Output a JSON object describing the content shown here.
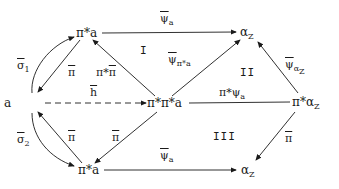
{
  "diagram": {
    "type": "commutative-diagram",
    "nodes": {
      "top_left": "π*a",
      "top_right_base": "α",
      "top_right_sub": "Z",
      "left": "a",
      "center": "π*π*a",
      "right_base": "π*α",
      "right_sub": "Z",
      "bottom_left": "π*a",
      "bottom_right_base": "α",
      "bottom_right_sub": "Z"
    },
    "edges": {
      "top_psi_base": "ψ",
      "top_psi_sub": "a",
      "sigma1_base": "σ",
      "sigma1_sub": "1",
      "sigma2_base": "σ",
      "sigma2_sub": "2",
      "pi_up": "π",
      "pistar_pi": "π*",
      "pistar_pi_bar": "π",
      "h_bar": "h",
      "psi_pistar_base": "ψ",
      "psi_pistar_sub": "π*a",
      "pistar_psi_prefix": "π*ψ",
      "pistar_psi_sub": "a",
      "psi_alpha_base": "ψ",
      "psi_alpha_sub": "α",
      "psi_alpha_subsub": "Z",
      "pi_bottom_left": "π",
      "pi_bottom_center": "π",
      "pi_right": "π",
      "bottom_psi_base": "ψ",
      "bottom_psi_sub": "a"
    },
    "regions": [
      "I",
      "II",
      "III"
    ]
  }
}
